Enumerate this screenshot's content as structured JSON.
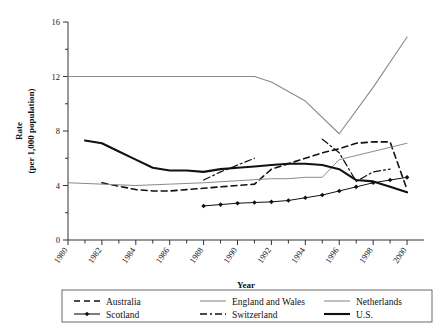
{
  "chart_data": {
    "type": "line",
    "title": "",
    "xlabel": "Year",
    "ylabel": "Rate\n(per 1,000 population)",
    "ylabel_line1": "Rate",
    "ylabel_line2": "(per 1,000 population)",
    "xlim": [
      1980,
      2001
    ],
    "ylim": [
      0,
      16
    ],
    "yticks": [
      0,
      4,
      8,
      12,
      16
    ],
    "ytick_labels": [
      "0",
      "4",
      "8",
      "12",
      "16"
    ],
    "yminor_ticks": [
      2,
      6,
      10,
      14
    ],
    "xticks": [
      1980,
      1981,
      1982,
      1983,
      1984,
      1985,
      1986,
      1987,
      1988,
      1989,
      1990,
      1991,
      1992,
      1993,
      1994,
      1995,
      1996,
      1997,
      1998,
      1999,
      2000
    ],
    "xtick_labels": [
      "1980",
      "1982",
      "1984",
      "1986",
      "1988",
      "1990",
      "1992",
      "1994",
      "1996",
      "1998",
      "2000"
    ],
    "xtick_label_years": [
      1980,
      1982,
      1984,
      1986,
      1988,
      1990,
      1992,
      1994,
      1996,
      1998,
      2000
    ],
    "grid": false,
    "legend_position": "bottom",
    "series": [
      {
        "name": "Australia",
        "style": "dashed",
        "color": "#111111",
        "width": 1.6,
        "marker": "none",
        "x": [
          1982,
          1984,
          1985,
          1986,
          1987,
          1988,
          1989,
          1990,
          1991,
          1992,
          1993,
          1994,
          1995,
          1996,
          1997,
          1998,
          1999,
          2000
        ],
        "y": [
          4.2,
          3.7,
          3.6,
          3.6,
          3.7,
          3.8,
          3.9,
          4.0,
          4.1,
          5.2,
          5.6,
          6.0,
          6.4,
          6.7,
          7.1,
          7.2,
          7.2,
          3.7
        ]
      },
      {
        "name": "Scotland",
        "style": "solid-marker",
        "color": "#111111",
        "width": 1.0,
        "marker": "diamond",
        "x": [
          1988,
          1989,
          1990,
          1991,
          1992,
          1993,
          1994,
          1995,
          1996,
          1997,
          1998,
          1999,
          2000
        ],
        "y": [
          2.5,
          2.6,
          2.7,
          2.75,
          2.8,
          2.9,
          3.1,
          3.3,
          3.6,
          3.9,
          4.2,
          4.4,
          4.6
        ]
      },
      {
        "name": "England and Wales",
        "style": "solid-thin",
        "color": "#8a8a8a",
        "width": 1.0,
        "marker": "none",
        "x": [
          1980,
          1982,
          1984,
          1986,
          1988,
          1990,
          1992,
          1993,
          1994,
          1995,
          1996,
          1997,
          1998,
          1999,
          2000
        ],
        "y": [
          4.2,
          4.1,
          4.0,
          4.1,
          4.2,
          4.35,
          4.5,
          4.5,
          4.6,
          4.6,
          5.9,
          6.2,
          6.5,
          6.8,
          7.1
        ]
      },
      {
        "name": "Switzerland",
        "style": "dash-dot",
        "color": "#111111",
        "width": 1.2,
        "marker": "none",
        "x": [
          1988,
          1989,
          1990,
          1991
        ],
        "y": [
          4.4,
          5.0,
          5.5,
          6.0
        ]
      },
      {
        "name": "Switzerland_segment2",
        "style": "dash-dot",
        "color": "#111111",
        "width": 1.2,
        "marker": "none",
        "x": [
          1995,
          1996,
          1997,
          1998,
          1999
        ],
        "y": [
          7.4,
          6.4,
          4.3,
          5.0,
          5.2
        ]
      },
      {
        "name": "Netherlands",
        "style": "solid-thin",
        "color": "#8a8a8a",
        "width": 1.1,
        "marker": "none",
        "x": [
          1980,
          1988,
          1991,
          1992,
          1994,
          1996,
          1998,
          2000
        ],
        "y": [
          12.0,
          12.0,
          12.0,
          11.6,
          10.2,
          7.8,
          11.2,
          14.9
        ]
      },
      {
        "name": "U.S.",
        "style": "solid-thick",
        "color": "#111111",
        "width": 2.1,
        "marker": "none",
        "x": [
          1981,
          1982,
          1983,
          1984,
          1985,
          1986,
          1987,
          1988,
          1989,
          1990,
          1991,
          1992,
          1993,
          1994,
          1995,
          1996,
          1997,
          1998,
          1999,
          2000
        ],
        "y": [
          7.3,
          7.1,
          6.5,
          5.9,
          5.3,
          5.1,
          5.1,
          5.0,
          5.2,
          5.3,
          5.4,
          5.5,
          5.6,
          5.6,
          5.5,
          5.2,
          4.4,
          4.3,
          3.9,
          3.5
        ]
      }
    ],
    "legend": [
      {
        "label": "Australia",
        "style": "dashed",
        "color": "#111111"
      },
      {
        "label": "England and Wales",
        "style": "solid-thin",
        "color": "#8a8a8a"
      },
      {
        "label": "Netherlands",
        "style": "solid-thin",
        "color": "#8a8a8a"
      },
      {
        "label": "Scotland",
        "style": "solid-marker",
        "color": "#111111"
      },
      {
        "label": "Switzerland",
        "style": "dash-dot",
        "color": "#111111"
      },
      {
        "label": "U.S.",
        "style": "solid-thick",
        "color": "#111111"
      }
    ]
  }
}
